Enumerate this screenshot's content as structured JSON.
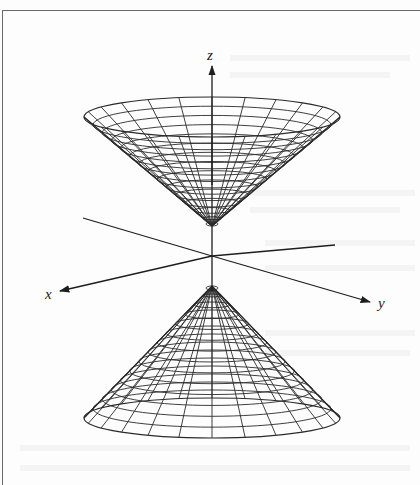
{
  "figure": {
    "surface": "cone",
    "axes": {
      "x_label": "x",
      "y_label": "y",
      "z_label": "z"
    },
    "nappes": [
      {
        "name": "upper nappe",
        "opens": "up",
        "rim_center": [
          212,
          117
        ],
        "rx": 128,
        "ry": 20,
        "vertex": [
          212,
          226
        ]
      },
      {
        "name": "lower nappe",
        "opens": "down",
        "rim_center": [
          212,
          418
        ],
        "rx": 128,
        "ry": 20,
        "vertex": [
          212,
          286
        ]
      }
    ],
    "mesh": {
      "meridians": 24,
      "parallels_upper": 14,
      "parallels_lower": 14
    },
    "colors": {
      "line": "#2a2a2a",
      "background": "#fdfdfd",
      "frame": "#6a6a6a"
    }
  }
}
